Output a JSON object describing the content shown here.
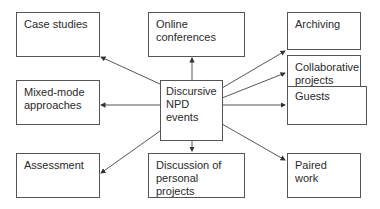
{
  "diagram": {
    "center": {
      "line1": "Discursive",
      "line2": "NPD",
      "line3": "events"
    },
    "nodes": {
      "case_studies": {
        "line1": "Case studies"
      },
      "online_conferences": {
        "line1": "Online",
        "line2": "conferences"
      },
      "archiving": {
        "line1": "Archiving"
      },
      "collaborative_projects": {
        "line1": "Collaborative",
        "line2": "projects"
      },
      "guests": {
        "line1": "Guests"
      },
      "mixed_mode": {
        "line1": "Mixed-mode",
        "line2": "approaches"
      },
      "assessment": {
        "line1": "Assessment"
      },
      "discussion": {
        "line1": "Discussion of",
        "line2": "personal projects"
      },
      "paired_work": {
        "line1": "Paired work"
      }
    },
    "colors": {
      "border": "#555555",
      "arrow": "#333333",
      "text": "#2a2a2a"
    }
  }
}
